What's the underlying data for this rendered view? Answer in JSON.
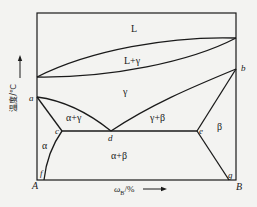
{
  "diagram": {
    "type": "binary-phase-diagram",
    "axes": {
      "y_label": "温度/℃",
      "x_label_main": "ω",
      "x_label_sub": "B",
      "x_label_unit": "/%"
    },
    "corners": {
      "left": "A",
      "right": "B"
    },
    "points": {
      "a": "a",
      "b": "b",
      "c": "c",
      "d": "d",
      "e": "e",
      "f": "f",
      "g": "g"
    },
    "regions": {
      "liquid": "L",
      "liquid_gamma": "L+γ",
      "gamma": "γ",
      "alpha_gamma": "α+γ",
      "gamma_beta": "γ+β",
      "alpha": "α",
      "beta": "β",
      "alpha_beta": "α+β"
    },
    "colors": {
      "line": "#1a1a1a",
      "background": "#f3f3f1"
    }
  }
}
